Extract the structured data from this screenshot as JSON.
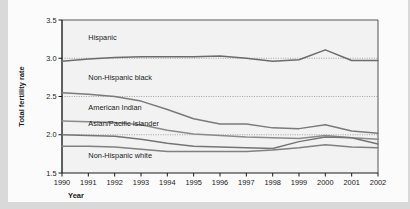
{
  "chart_data": {
    "type": "line",
    "title": "",
    "xlabel": "Year",
    "ylabel": "Total fertility rate",
    "x": [
      1990,
      1991,
      1992,
      1993,
      1994,
      1995,
      1996,
      1997,
      1998,
      1999,
      2000,
      2001,
      2002
    ],
    "categories": [
      "1990",
      "1991",
      "1992",
      "1993",
      "1994",
      "1995",
      "1996",
      "1997",
      "1998",
      "1999",
      "2000",
      "2001",
      "2002"
    ],
    "xlim": [
      1990,
      2002
    ],
    "ylim": [
      1.5,
      3.5
    ],
    "yticks": [
      "1.5",
      "2.0",
      "2.5",
      "3.0",
      "3.5"
    ],
    "ytick_values": [
      1.5,
      2.0,
      2.5,
      3.0,
      3.5
    ],
    "grid": "dotted horizontal reference lines at 2.0, 2.5 and 3.0",
    "legend": "inline labels placed next to each line",
    "series": [
      {
        "name": "Hispanic",
        "label": "Hispanic",
        "color": "#6b6b6b",
        "values": [
          2.96,
          2.99,
          3.01,
          3.02,
          3.02,
          3.02,
          3.03,
          3.0,
          2.96,
          2.98,
          3.11,
          2.97,
          2.97
        ]
      },
      {
        "name": "Non-Hispanic black",
        "label": "Non-Hispanic black",
        "color": "#7a7a7a",
        "values": [
          2.55,
          2.53,
          2.5,
          2.44,
          2.33,
          2.21,
          2.14,
          2.14,
          2.09,
          2.08,
          2.13,
          2.05,
          2.02
        ]
      },
      {
        "name": "American Indian",
        "label": "American Indian",
        "color": "#8a8a8a",
        "values": [
          2.18,
          2.17,
          2.16,
          2.13,
          2.06,
          2.01,
          1.99,
          1.97,
          1.96,
          1.95,
          1.99,
          1.96,
          1.94
        ]
      },
      {
        "name": "Asian/Pacific Islander",
        "label": "Asian/Pacific Islander",
        "color": "#747474",
        "values": [
          2.0,
          1.99,
          1.98,
          1.94,
          1.89,
          1.85,
          1.84,
          1.83,
          1.82,
          1.91,
          1.97,
          1.96,
          1.88
        ]
      },
      {
        "name": "Non-Hispanic white",
        "label": "Non-Hispanic white",
        "color": "#808080",
        "values": [
          1.85,
          1.85,
          1.84,
          1.81,
          1.78,
          1.78,
          1.78,
          1.78,
          1.8,
          1.83,
          1.87,
          1.84,
          1.83
        ]
      }
    ],
    "series_label_positions": [
      {
        "name": "Hispanic",
        "x": 1991.0,
        "y": 3.24
      },
      {
        "name": "Non-Hispanic black",
        "x": 1991.0,
        "y": 2.72
      },
      {
        "name": "American Indian",
        "x": 1991.0,
        "y": 2.33
      },
      {
        "name": "Asian/Pacific Islander",
        "x": 1991.0,
        "y": 2.11
      },
      {
        "name": "Non-Hispanic white",
        "x": 1991.0,
        "y": 1.69
      }
    ],
    "reference_lines": [
      3.0,
      2.5,
      2.0
    ]
  }
}
